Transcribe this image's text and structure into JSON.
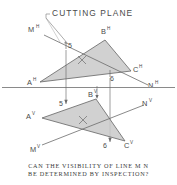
{
  "figure": {
    "title": "CUTTING PLANE",
    "caption_line1": "CAN THE VISIBILITY OF LINE M N",
    "caption_line2": "BE DETERMINED BY INSPECTION?",
    "colors": {
      "ink": "#4a4a4a",
      "line": "#6b6b6b",
      "fill": "#c9c9c9",
      "ground_line": "#8a8a8a",
      "background": "#ffffff"
    },
    "top_view": {
      "name": "horizontal-view",
      "vertices": [
        {
          "id": "A",
          "label": "A",
          "superscript": "H",
          "x": 37,
          "y": 82
        },
        {
          "id": "B",
          "label": "B",
          "superscript": "H",
          "x": 105,
          "y": 37
        },
        {
          "id": "C",
          "label": "C",
          "superscript": "H",
          "x": 133,
          "y": 70
        }
      ],
      "line_endpoints": [
        {
          "id": "M",
          "label": "M",
          "superscript": "H",
          "x": 36,
          "y": 31
        },
        {
          "id": "N",
          "label": "N",
          "superscript": "H",
          "x": 152,
          "y": 86
        }
      ],
      "pierce_points": [
        {
          "label": "5",
          "x": 70,
          "y": 48
        },
        {
          "label": "6",
          "x": 113,
          "y": 75
        }
      ],
      "center_mark": "x"
    },
    "front_view": {
      "name": "frontal-view",
      "vertices": [
        {
          "id": "A",
          "label": "A",
          "superscript": "V",
          "x": 35,
          "y": 117
        },
        {
          "id": "B",
          "label": "B",
          "superscript": "V",
          "x": 97,
          "y": 95
        },
        {
          "id": "C",
          "label": "C",
          "superscript": "V",
          "x": 127,
          "y": 143
        }
      ],
      "line_endpoints": [
        {
          "id": "M",
          "label": "M",
          "superscript": "V",
          "x": 38,
          "y": 148
        },
        {
          "id": "N",
          "label": "N",
          "superscript": "V",
          "x": 146,
          "y": 108
        }
      ],
      "pierce_points": [
        {
          "label": "5",
          "x": 73,
          "y": 104
        },
        {
          "label": "6",
          "x": 112,
          "y": 141
        }
      ],
      "center_mark": "x"
    },
    "ground_line": {
      "name": "ground-line",
      "y": 87
    }
  }
}
